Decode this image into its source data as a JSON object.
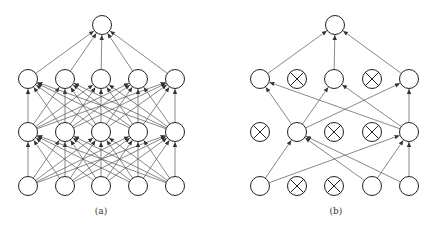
{
  "panels": [
    {
      "label": "(a)",
      "label_pos": [
        101,
        207
      ],
      "layers_y": [
        186,
        132,
        79
      ],
      "layers_x": [
        28,
        65,
        101,
        138,
        175
      ],
      "output": [
        102,
        25
      ],
      "dropped": [
        [],
        [],
        []
      ],
      "full": true
    },
    {
      "label": "(b)",
      "label_pos": [
        336,
        207
      ],
      "layers_y": [
        186,
        132,
        79
      ],
      "layers_x": [
        260,
        297,
        334,
        372,
        409
      ],
      "output": [
        335,
        25
      ],
      "dropped": [
        [
          1,
          2
        ],
        [
          0,
          2,
          3
        ],
        [
          1,
          3
        ]
      ],
      "full": false,
      "edges": [
        [
          [
            0,
            1
          ],
          [
            0,
            4
          ],
          [
            3,
            1
          ],
          [
            3,
            4
          ],
          [
            4,
            1
          ],
          [
            4,
            4
          ]
        ],
        [
          [
            1,
            0
          ],
          [
            1,
            2
          ],
          [
            1,
            4
          ],
          [
            4,
            0
          ],
          [
            4,
            2
          ],
          [
            4,
            4
          ]
        ]
      ],
      "output_from": [
        0,
        2,
        4
      ]
    }
  ],
  "style": {
    "node_radius": 9.5,
    "line_color": "#555555",
    "node_stroke": "#222222"
  }
}
